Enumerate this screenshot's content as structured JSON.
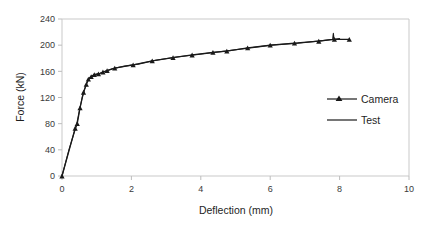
{
  "chart_data": {
    "type": "line",
    "title": "",
    "xlabel": "Deflection  (mm)",
    "ylabel": "Force  (kN)",
    "xlim": [
      0,
      10
    ],
    "ylim": [
      0,
      240
    ],
    "xticks": [
      "0",
      "2",
      "4",
      "6",
      "8",
      "10"
    ],
    "xtick_values": [
      0,
      2,
      4,
      6,
      8,
      10
    ],
    "yticks": [
      "0",
      "40",
      "80",
      "120",
      "160",
      "200",
      "240"
    ],
    "ytick_values": [
      0,
      40,
      80,
      120,
      160,
      200,
      240
    ],
    "grid": false,
    "legend_position": "right-middle",
    "series": [
      {
        "name": "Camera",
        "marker": "triangle",
        "color": "#1a1a1a",
        "points": [
          [
            0.0,
            0
          ],
          [
            0.38,
            73
          ],
          [
            0.44,
            80
          ],
          [
            0.52,
            104
          ],
          [
            0.62,
            128
          ],
          [
            0.7,
            140
          ],
          [
            0.76,
            148
          ],
          [
            0.84,
            152
          ],
          [
            0.93,
            155
          ],
          [
            1.05,
            156
          ],
          [
            1.18,
            159
          ],
          [
            1.3,
            161
          ],
          [
            1.52,
            165
          ],
          [
            2.05,
            170
          ],
          [
            2.6,
            176
          ],
          [
            3.2,
            181
          ],
          [
            3.75,
            185
          ],
          [
            4.35,
            189
          ],
          [
            4.75,
            191
          ],
          [
            5.35,
            196
          ],
          [
            6.0,
            200
          ],
          [
            6.7,
            203
          ],
          [
            7.4,
            206
          ],
          [
            7.85,
            209
          ],
          [
            8.28,
            209
          ]
        ]
      },
      {
        "name": "Test",
        "marker": "none",
        "color": "#1a1a1a",
        "points": [
          [
            0.0,
            0
          ],
          [
            0.2,
            40
          ],
          [
            0.36,
            68
          ],
          [
            0.42,
            78
          ],
          [
            0.5,
            100
          ],
          [
            0.58,
            120
          ],
          [
            0.66,
            134
          ],
          [
            0.72,
            143
          ],
          [
            0.78,
            149
          ],
          [
            0.86,
            153
          ],
          [
            0.95,
            155
          ],
          [
            1.1,
            157
          ],
          [
            1.25,
            160
          ],
          [
            1.45,
            164
          ],
          [
            1.8,
            168
          ],
          [
            2.2,
            171
          ],
          [
            2.7,
            177
          ],
          [
            3.3,
            182
          ],
          [
            3.8,
            185
          ],
          [
            4.4,
            189
          ],
          [
            5.0,
            193
          ],
          [
            5.6,
            197
          ],
          [
            6.05,
            200
          ],
          [
            6.8,
            203
          ],
          [
            7.5,
            207
          ],
          [
            7.8,
            209
          ],
          [
            7.82,
            218
          ],
          [
            7.84,
            209
          ],
          [
            8.0,
            210
          ]
        ]
      }
    ]
  },
  "legend": {
    "items": [
      {
        "label": "Camera",
        "type": "line-marker"
      },
      {
        "label": "Test",
        "type": "line"
      }
    ]
  }
}
